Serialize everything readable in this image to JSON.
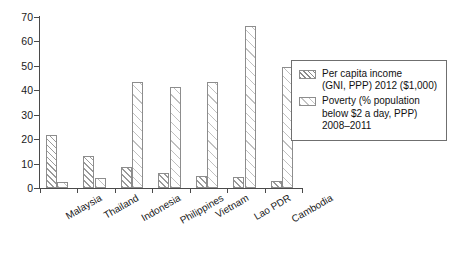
{
  "chart_data": {
    "type": "bar",
    "title": "",
    "subtitle": "",
    "xlabel": "",
    "ylabel": "",
    "ylim": [
      0,
      70
    ],
    "yticks": [
      0,
      10,
      20,
      30,
      40,
      50,
      60,
      70
    ],
    "grid": false,
    "legend_position": "right",
    "categories": [
      "Malaysia",
      "Thailand",
      "Indonesia",
      "Philippines",
      "Vietnam",
      "Lao PDR",
      "Cambodia"
    ],
    "series": [
      {
        "name": "Per capita income (GNI, PPP) 2012 ($1,000)",
        "key": "income",
        "values": [
          21.5,
          13.0,
          8.8,
          6.3,
          5.0,
          4.4,
          3.0
        ]
      },
      {
        "name": "Poverty (% population below $2 a day, PPP) 2008–2011",
        "key": "poverty",
        "values": [
          2.3,
          4.0,
          43.3,
          41.5,
          43.4,
          66.5,
          49.5
        ]
      }
    ]
  },
  "legend": {
    "entries": [
      {
        "swatch": "income",
        "lines": [
          "Per capita income",
          "(GNI, PPP) 2012 ($1,000)"
        ]
      },
      {
        "swatch": "poverty",
        "lines": [
          "Poverty (% population",
          "below $2 a day, PPP)",
          "2008–2011"
        ]
      }
    ]
  }
}
